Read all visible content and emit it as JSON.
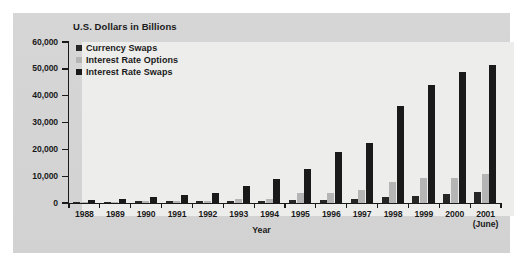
{
  "chart_data": {
    "type": "bar",
    "title": "",
    "axis_note": "U.S. Dollars in Billions",
    "xlabel": "Year",
    "ylabel": "",
    "ylim": [
      0,
      60000
    ],
    "ytick_values": [
      0,
      10000,
      20000,
      30000,
      40000,
      50000,
      60000
    ],
    "ytick_labels": [
      "0",
      "10,000",
      "20,000",
      "30,000",
      "40,000",
      "50,000",
      "60,000"
    ],
    "grid": false,
    "legend_position": "upper-left-inside",
    "categories": [
      "1988",
      "1989",
      "1990",
      "1991",
      "1992",
      "1993",
      "1994",
      "1995",
      "1996",
      "1997",
      "1998",
      "1999",
      "2000",
      "2001"
    ],
    "category_sublabels": [
      "",
      "",
      "",
      "",
      "",
      "",
      "",
      "",
      "",
      "",
      "",
      "",
      "",
      "(June)"
    ],
    "series": [
      {
        "name": "Currency Swaps",
        "color": "#262626",
        "values": [
          320,
          450,
          578,
          807,
          860,
          900,
          915,
          1197,
          1295,
          1585,
          2253,
          2444,
          3194,
          3942
        ]
      },
      {
        "name": "Interest Rate Options",
        "color": "#b5b5b5",
        "values": [
          327,
          537,
          561,
          577,
          634,
          1398,
          1573,
          3705,
          3704,
          4920,
          7997,
          9380,
          9476,
          10933
        ]
      },
      {
        "name": "Interest Rate Swaps",
        "color": "#1a1a1a",
        "values": [
          1010,
          1503,
          2312,
          3065,
          3851,
          6177,
          8816,
          12811,
          19171,
          22291,
          36262,
          43936,
          48768,
          51407
        ]
      }
    ]
  },
  "legend": {
    "items": [
      {
        "label": "Currency Swaps",
        "color": "#262626"
      },
      {
        "label": "Interest Rate Options",
        "color": "#b5b5b5"
      },
      {
        "label": "Interest Rate Swaps",
        "color": "#1a1a1a"
      }
    ]
  },
  "labels": {
    "unit_note": "U.S. Dollars in Billions",
    "x_axis_title": "Year"
  }
}
